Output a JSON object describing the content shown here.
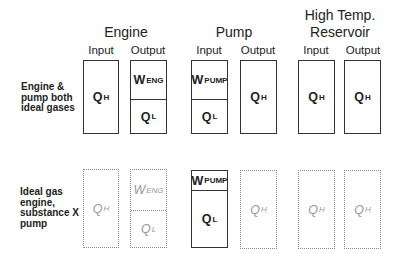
{
  "groups": {
    "engine": {
      "title": "Engine",
      "input": "Input",
      "output": "Output"
    },
    "pump": {
      "title": "Pump",
      "input": "Input",
      "output": "Output"
    },
    "reservoir": {
      "title_line1": "High Temp.",
      "title_line2": "Reservoir",
      "input": "Input",
      "output": "Output"
    }
  },
  "rows": [
    {
      "label_lines": [
        "Engine &",
        "pump both",
        "ideal gases"
      ],
      "style": "solid",
      "engine_input": [
        {
          "sym": "Q",
          "sub": "H"
        }
      ],
      "engine_output": [
        {
          "sym": "W",
          "sub": "ENG"
        },
        {
          "sym": "Q",
          "sub": "L"
        }
      ],
      "pump_input": [
        {
          "sym": "W",
          "sub": "PUMP"
        },
        {
          "sym": "Q",
          "sub": "L"
        }
      ],
      "pump_output": [
        {
          "sym": "Q",
          "sub": "H"
        }
      ],
      "reservoir_input": [
        {
          "sym": "Q",
          "sub": "H"
        }
      ],
      "reservoir_output": [
        {
          "sym": "Q",
          "sub": "H"
        }
      ]
    },
    {
      "label_lines": [
        "Ideal gas",
        "engine,",
        "substance X",
        "pump"
      ],
      "style": "mixed",
      "engine_input": [
        {
          "sym": "Q",
          "sub": "H"
        }
      ],
      "engine_output": [
        {
          "sym": "W",
          "sub": "ENG"
        },
        {
          "sym": "Q",
          "sub": "L"
        }
      ],
      "pump_input": [
        {
          "sym": "W",
          "sub": "PUMP"
        },
        {
          "sym": "Q",
          "sub": "L"
        }
      ],
      "pump_output": [
        {
          "sym": "Q",
          "sub": "H"
        }
      ],
      "reservoir_input": [
        {
          "sym": "Q",
          "sub": "H"
        }
      ],
      "reservoir_output": [
        {
          "sym": "Q",
          "sub": "H"
        }
      ]
    }
  ]
}
